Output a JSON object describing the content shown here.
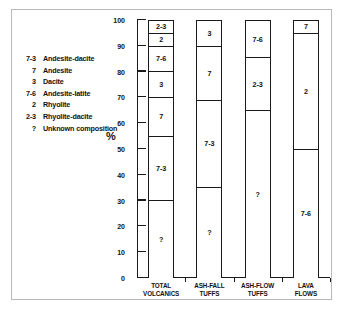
{
  "legend": {
    "items": [
      {
        "key": "7-3",
        "label": "Andesite-dacite"
      },
      {
        "key": "7",
        "label": "Andesite"
      },
      {
        "key": "3",
        "label": "Dacite"
      },
      {
        "key": "7-6",
        "label": "Andesite-latite"
      },
      {
        "key": "2",
        "label": "Rhyolite"
      },
      {
        "key": "2-3",
        "label": "Rhyolite-dacite"
      },
      {
        "key": "?",
        "label": "Unknown composition"
      }
    ]
  },
  "axis": {
    "y_title": "%",
    "y_ticks": [
      "0",
      "10",
      "20",
      "30",
      "40",
      "50",
      "60",
      "70",
      "80",
      "90",
      "100"
    ]
  },
  "chart_data": {
    "type": "bar",
    "subtype": "stacked-100-percent",
    "title": "",
    "xlabel": "",
    "ylabel": "%",
    "ylim": [
      0,
      100
    ],
    "ytick_values": [
      0,
      10,
      20,
      30,
      40,
      50,
      60,
      70,
      80,
      90,
      100
    ],
    "grid": false,
    "legend_position": "left",
    "categories": [
      "TOTAL\nVOLCANICS",
      "ASH-FALL\nTUFFS",
      "ASH-FLOW\nTUFFS",
      "LAVA\nFLOWS"
    ],
    "category_lines": [
      [
        "TOTAL",
        "VOLCANICS"
      ],
      [
        "ASH-FALL",
        "TUFFS"
      ],
      [
        "ASH-FLOW",
        "TUFFS"
      ],
      [
        "LAVA",
        "FLOWS"
      ]
    ],
    "bars": [
      {
        "category": "TOTAL VOLCANICS",
        "segments": [
          {
            "label": "?",
            "from": 0,
            "to": 30,
            "value": 30
          },
          {
            "label": "7-3",
            "from": 30,
            "to": 55,
            "value": 25
          },
          {
            "label": "7",
            "from": 55,
            "to": 70,
            "value": 15
          },
          {
            "label": "3",
            "from": 70,
            "to": 80,
            "value": 10
          },
          {
            "label": "7-6",
            "from": 80,
            "to": 90,
            "value": 10
          },
          {
            "label": "2",
            "from": 90,
            "to": 95,
            "value": 5
          },
          {
            "label": "2-3",
            "from": 95,
            "to": 100,
            "value": 5
          }
        ]
      },
      {
        "category": "ASH-FALL TUFFS",
        "segments": [
          {
            "label": "?",
            "from": 0,
            "to": 35,
            "value": 35
          },
          {
            "label": "7-3",
            "from": 35,
            "to": 69,
            "value": 34
          },
          {
            "label": "7",
            "from": 69,
            "to": 90,
            "value": 21
          },
          {
            "label": "3",
            "from": 90,
            "to": 100,
            "value": 10
          }
        ]
      },
      {
        "category": "ASH-FLOW TUFFS",
        "segments": [
          {
            "label": "?",
            "from": 0,
            "to": 65,
            "value": 65
          },
          {
            "label": "2-3",
            "from": 65,
            "to": 85.5,
            "value": 20.5
          },
          {
            "label": "7-6",
            "from": 85.5,
            "to": 100,
            "value": 14.5
          }
        ]
      },
      {
        "category": "LAVA FLOWS",
        "segments": [
          {
            "label": "7-6",
            "from": 0,
            "to": 50,
            "value": 50
          },
          {
            "label": "2",
            "from": 50,
            "to": 95,
            "value": 45
          },
          {
            "label": "7",
            "from": 95,
            "to": 100,
            "value": 5
          }
        ]
      }
    ]
  }
}
